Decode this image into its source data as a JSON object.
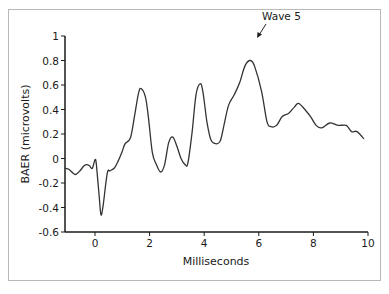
{
  "chart_data": {
    "type": "line",
    "title": "",
    "xlabel": "Milliseconds",
    "ylabel": "BAER (microvolts)",
    "xlim": [
      -1.1,
      10
    ],
    "ylim": [
      -0.6,
      1
    ],
    "grid": false,
    "legend": null,
    "x_ticks": [
      0,
      2,
      4,
      6,
      8,
      10
    ],
    "x_tick_labels": [
      "0",
      "2",
      "4",
      "6",
      "8",
      "10"
    ],
    "y_ticks": [
      -0.6,
      -0.4,
      -0.2,
      0,
      0.2,
      0.4,
      0.6,
      0.8,
      1
    ],
    "y_tick_labels": [
      "-0.6",
      "-0.4",
      "-0.2",
      "0",
      "0.2",
      "0.4",
      "0.6",
      "0.8",
      "1"
    ],
    "annotations": [
      {
        "text": "Wave 5",
        "x": 5.7,
        "y": 0.8
      }
    ],
    "series": [
      {
        "name": "BAER",
        "x": [
          -1.1,
          -0.95,
          -0.8,
          -0.7,
          -0.55,
          -0.4,
          -0.3,
          -0.2,
          -0.1,
          0.0,
          0.05,
          0.15,
          0.22,
          0.3,
          0.45,
          0.55,
          0.7,
          0.85,
          1.0,
          1.1,
          1.3,
          1.45,
          1.6,
          1.7,
          1.85,
          1.95,
          2.1,
          2.25,
          2.4,
          2.55,
          2.7,
          2.85,
          3.0,
          3.15,
          3.3,
          3.4,
          3.55,
          3.7,
          3.85,
          3.95,
          4.1,
          4.25,
          4.45,
          4.6,
          4.75,
          4.9,
          5.1,
          5.3,
          5.5,
          5.7,
          5.85,
          6.1,
          6.3,
          6.45,
          6.65,
          6.85,
          7.1,
          7.3,
          7.45,
          7.65,
          7.9,
          8.1,
          8.3,
          8.6,
          8.9,
          9.2,
          9.4,
          9.6,
          9.85
        ],
        "values": [
          -0.08,
          -0.09,
          -0.12,
          -0.13,
          -0.1,
          -0.06,
          -0.05,
          -0.06,
          -0.08,
          -0.01,
          -0.05,
          -0.3,
          -0.46,
          -0.38,
          -0.12,
          -0.1,
          -0.08,
          -0.02,
          0.06,
          0.12,
          0.17,
          0.35,
          0.54,
          0.57,
          0.5,
          0.35,
          0.05,
          -0.05,
          -0.11,
          -0.05,
          0.13,
          0.175,
          0.1,
          0.0,
          -0.05,
          -0.04,
          0.2,
          0.52,
          0.61,
          0.55,
          0.3,
          0.15,
          0.12,
          0.15,
          0.3,
          0.44,
          0.52,
          0.62,
          0.76,
          0.8,
          0.75,
          0.55,
          0.3,
          0.26,
          0.27,
          0.34,
          0.37,
          0.42,
          0.45,
          0.41,
          0.34,
          0.27,
          0.25,
          0.29,
          0.27,
          0.27,
          0.22,
          0.22,
          0.16
        ]
      }
    ]
  },
  "layout": {
    "plot_left_px": 65,
    "plot_right_px": 370,
    "x_zero_px": 95,
    "px_per_ms": 27.3,
    "y_zero_px": 158.5,
    "px_per_unit": 122.5,
    "line_color": "#333333",
    "axis_color": "#1a1a1a"
  }
}
